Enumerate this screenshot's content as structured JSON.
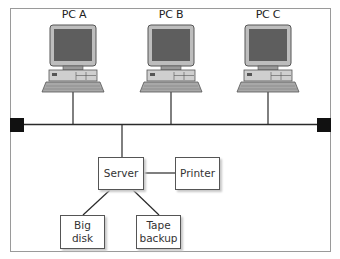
{
  "diagram": {
    "type": "bus network topology",
    "computers": [
      {
        "label": "PC A"
      },
      {
        "label": "PC B"
      },
      {
        "label": "PC C"
      }
    ],
    "bus": {
      "terminators": [
        "left-terminator",
        "right-terminator"
      ]
    },
    "devices": {
      "server": {
        "label": "Server"
      },
      "printer": {
        "label": "Printer"
      },
      "big_disk": {
        "line1": "Big",
        "line2": "disk"
      },
      "tape_backup": {
        "line1": "Tape",
        "line2": "backup"
      }
    },
    "connections": [
      [
        "PC A",
        "bus"
      ],
      [
        "PC B",
        "bus"
      ],
      [
        "PC C",
        "bus"
      ],
      [
        "Server",
        "bus"
      ],
      [
        "Server",
        "Printer"
      ],
      [
        "Server",
        "Big disk"
      ],
      [
        "Server",
        "Tape backup"
      ]
    ],
    "colors": {
      "line": "#2a2a2a",
      "terminator": "#111111",
      "monitor_screen": "#5e5e5e",
      "monitor_body": "#bdbdbd",
      "frame": "#9a9a9a"
    }
  }
}
